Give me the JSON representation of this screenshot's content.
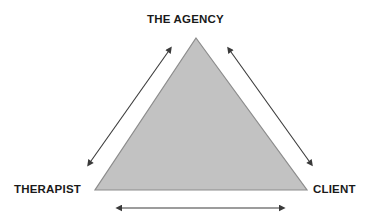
{
  "diagram": {
    "title": "THE AGENCY",
    "type": "triangle-relationship",
    "nodes": [
      {
        "id": "agency",
        "label": "THE AGENCY",
        "position": "apex"
      },
      {
        "id": "therapist",
        "label": "THERAPIST",
        "position": "bottom-left"
      },
      {
        "id": "client",
        "label": "CLIENT",
        "position": "bottom-right"
      }
    ],
    "edges": [
      {
        "id": "edge-therapist-agency",
        "from": "therapist",
        "to": "agency",
        "arrow": "double"
      },
      {
        "id": "edge-agency-client",
        "from": "agency",
        "to": "client",
        "arrow": "double"
      },
      {
        "id": "edge-therapist-client",
        "from": "therapist",
        "to": "client",
        "arrow": "double"
      }
    ],
    "shape": {
      "name": "filled-triangle",
      "apex": {
        "x": 196,
        "y": 38
      },
      "bottom_left": {
        "x": 95,
        "y": 190
      },
      "bottom_right": {
        "x": 307,
        "y": 190
      }
    },
    "colors": {
      "triangle_fill": "#c2c2c2",
      "triangle_stroke": "#8c8c8c",
      "arrow": "#3a3a3a",
      "text": "#1a1a1a",
      "background": "#ffffff"
    }
  }
}
